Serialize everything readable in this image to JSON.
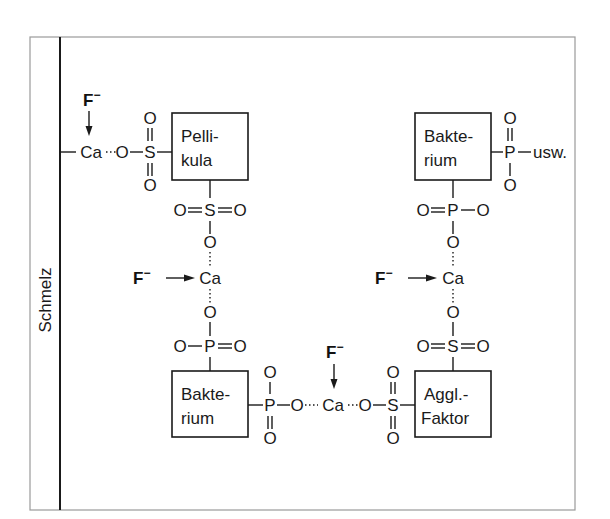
{
  "diagram": {
    "enamel_label": "Schmelz",
    "fluoride": "F",
    "fluoride_charge": "−",
    "atoms": {
      "calcium": "Ca",
      "oxygen": "O",
      "sulfur": "S",
      "phosphorus": "P"
    },
    "continuation": "usw.",
    "boxes": {
      "pellikula": [
        "Pelli-",
        "kula"
      ],
      "bakterium_bottom": [
        "Bakte-",
        "rium"
      ],
      "bakterium_top": [
        "Bakte-",
        "rium"
      ],
      "aggl_faktor": [
        "Aggl.-",
        "Faktor"
      ]
    },
    "colors": {
      "ink": "#1a1a1a",
      "frame": "#9a9a9a",
      "background": "#ffffff"
    }
  }
}
